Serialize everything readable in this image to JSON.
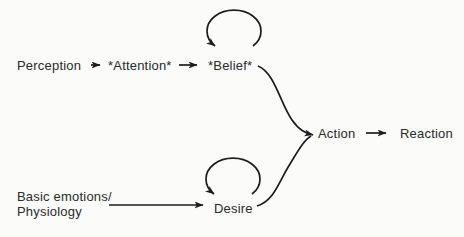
{
  "diagram": {
    "nodes": {
      "perception": {
        "label": "Perception"
      },
      "attention": {
        "label": "*Attention*"
      },
      "belief": {
        "label": "*Belief*"
      },
      "action": {
        "label": "Action"
      },
      "reaction": {
        "label": "Reaction"
      },
      "desire": {
        "label": "Desire"
      },
      "basic_emotions": {
        "line1": "Basic emotions/",
        "line2": "Physiology"
      }
    },
    "edges": [
      {
        "from": "Perception",
        "to": "*Attention*",
        "style": "straight-arrow"
      },
      {
        "from": "*Attention*",
        "to": "*Belief*",
        "style": "straight-arrow"
      },
      {
        "from": "*Belief*",
        "to": "*Belief*",
        "style": "self-loop"
      },
      {
        "from": "*Belief*",
        "to": "Action",
        "style": "curved-arrow"
      },
      {
        "from": "Basic emotions/Physiology",
        "to": "Desire",
        "style": "straight-arrow"
      },
      {
        "from": "Desire",
        "to": "Desire",
        "style": "self-loop"
      },
      {
        "from": "Desire",
        "to": "Action",
        "style": "curved-arrow"
      },
      {
        "from": "Action",
        "to": "Reaction",
        "style": "straight-arrow"
      }
    ],
    "colors": {
      "background": "#fbfbfa",
      "line": "#1d1d1d",
      "text": "#2a2a2a"
    }
  }
}
